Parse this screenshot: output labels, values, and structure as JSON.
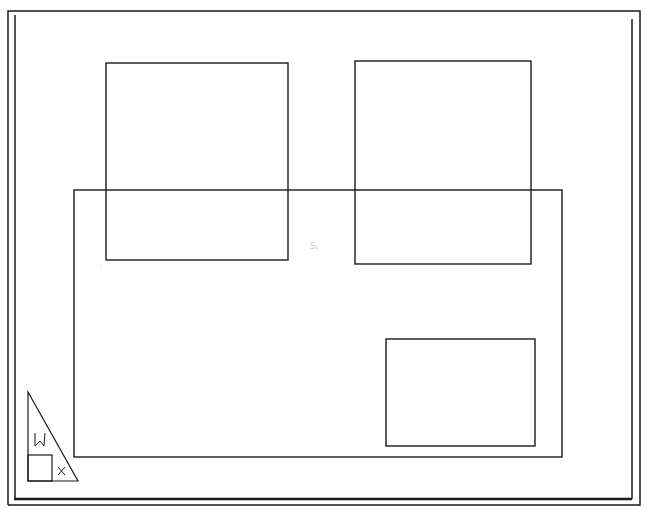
{
  "drawing": {
    "type": "CAD paper space layout",
    "stroke_color": "#1a1a1a",
    "background": "#ffffff",
    "sheet_border": {
      "outer": {
        "x": 8,
        "y": 10,
        "w": 632,
        "h": 496
      },
      "inner": {
        "x": 14,
        "y": 13,
        "w": 618,
        "h": 487
      }
    },
    "viewports": [
      {
        "name": "viewport-top-left",
        "x": 106,
        "y": 63,
        "w": 182,
        "h": 197
      },
      {
        "name": "viewport-top-right",
        "x": 355,
        "y": 61,
        "w": 176,
        "h": 203
      },
      {
        "name": "viewport-large",
        "x": 74,
        "y": 190,
        "w": 488,
        "h": 267
      },
      {
        "name": "viewport-small",
        "x": 386,
        "y": 339,
        "w": 149,
        "h": 107
      }
    ],
    "ucs_icon": {
      "label_w": "W",
      "label_x": "X"
    },
    "annotations": [
      {
        "text": "S₁",
        "x": 313,
        "y": 251
      },
      {
        "text": "ᵎ",
        "x": 101,
        "y": 270
      }
    ]
  }
}
